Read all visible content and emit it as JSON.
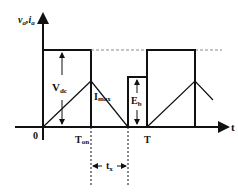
{
  "diagram": {
    "y_axis_label": "v",
    "y_axis_sub1": "a",
    "y_axis_sep": ",",
    "y_axis_label2": "i",
    "y_axis_sub2": "a",
    "x_axis_label": "t",
    "origin_label": "0",
    "labels": {
      "vdc": "V",
      "vdc_sub": "dc",
      "imax": "I",
      "imax_sub": "max",
      "eb": "E",
      "eb_sub": "b",
      "ton": "T",
      "ton_sub": "on",
      "period": "T",
      "tx": "t",
      "tx_sub": "x"
    },
    "colors": {
      "line": "#111111",
      "dashed": "#888888"
    }
  }
}
